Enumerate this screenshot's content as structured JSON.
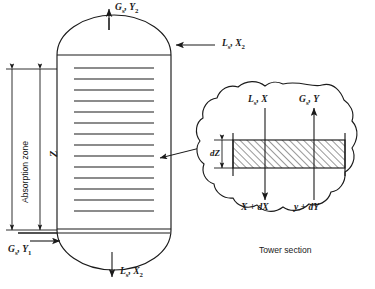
{
  "figure": {
    "caption": "Tower section"
  },
  "tower": {
    "name": "packed absorption tower",
    "zone_label": "Absorption zone",
    "height_label": "Z",
    "tray_count": 14,
    "streams": {
      "gas_out_top": {
        "symbol": "G",
        "symbol_sub": "s",
        "var": "Y",
        "var_sub": "2",
        "text": "Gs, Y2"
      },
      "liquid_in_top": {
        "symbol": "L",
        "symbol_sub": "s",
        "var": "X",
        "var_sub": "2",
        "text": "Ls, X2"
      },
      "gas_in_bottom": {
        "symbol": "G",
        "symbol_sub": "s",
        "var": "Y",
        "var_sub": "1",
        "text": "Gs, Y1"
      },
      "liquid_out_bottom": {
        "symbol": "L",
        "symbol_sub": "s",
        "var": "X",
        "var_sub": "2",
        "text": "Ls, X2"
      }
    }
  },
  "detail": {
    "name": "tower-section-detail",
    "thickness_label": "dZ",
    "liquid_in": {
      "symbol": "L",
      "symbol_sub": "s",
      "var": "X",
      "text": "Ls, X"
    },
    "gas_out": {
      "symbol": "G",
      "symbol_sub": "s",
      "var": "Y",
      "text": "Gs, Y"
    },
    "liquid_out": "X + dX",
    "gas_in": "y + dY"
  },
  "style": {
    "line_color": "#1a1a1a",
    "hatch_color": "#3a3a3a",
    "background": "#ffffff"
  }
}
